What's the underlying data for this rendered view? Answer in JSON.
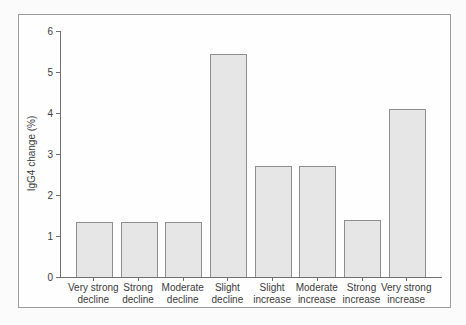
{
  "chart_data": {
    "type": "bar",
    "title": "",
    "xlabel": "",
    "ylabel": "IgG4 change (%)",
    "categories": [
      "Very strong\ndecline",
      "Strong\ndecline",
      "Moderate\ndecline",
      "Slight\ndecline",
      "Slight\nincrease",
      "Moderate\nincrease",
      "Strong\nincrease",
      "Very strong\nincrease"
    ],
    "values": [
      1.35,
      1.35,
      1.35,
      5.45,
      2.7,
      2.7,
      1.4,
      4.1
    ],
    "ylim": [
      0,
      6
    ],
    "yticks": [
      0,
      1,
      2,
      3,
      4,
      5,
      6
    ],
    "grid": false,
    "legend": null,
    "bar_fill": "#e6e6e6",
    "bar_border": "#8e8e8e",
    "axis_color": "#707070",
    "text_color": "#3c3c3c",
    "frame_border": "#9c9c9c"
  }
}
